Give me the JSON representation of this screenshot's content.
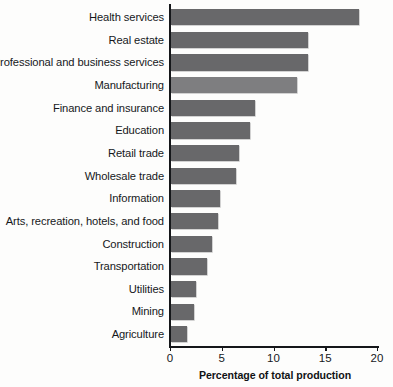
{
  "chart_data": {
    "type": "bar",
    "orientation": "horizontal",
    "title": "",
    "xlabel": "Percentage of total production",
    "ylabel": "",
    "xlim": [
      0,
      20
    ],
    "xticks": [
      0,
      5,
      10,
      15,
      20
    ],
    "xtick_labels": [
      "0",
      "5",
      "10",
      "15",
      "20"
    ],
    "grid": false,
    "legend": false,
    "bar_color": "#68686a",
    "highlight_color": "#7e7e80",
    "categories": [
      "Health services",
      "Real estate",
      "Professional and business services",
      "Manufacturing",
      "Finance and insurance",
      "Education",
      "Retail trade",
      "Wholesale trade",
      "Information",
      "Arts, recreation, hotels, and food",
      "Construction",
      "Transportation",
      "Utilities",
      "Mining",
      "Agriculture"
    ],
    "values": [
      18.2,
      13.2,
      13.2,
      12.2,
      8.1,
      7.6,
      6.6,
      6.3,
      4.7,
      4.5,
      4.0,
      3.5,
      2.4,
      2.2,
      1.5
    ],
    "bar_styles": [
      "dark",
      "dark",
      "dark",
      "light",
      "dark",
      "dark",
      "dark",
      "dark",
      "dark",
      "dark",
      "dark",
      "dark",
      "dark",
      "dark",
      "dark"
    ]
  }
}
